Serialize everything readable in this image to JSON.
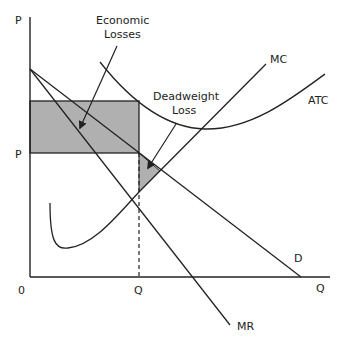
{
  "diagram": {
    "axes": {
      "y_label": "P",
      "x_label": "Q",
      "origin_label": "0",
      "price_tick": "P",
      "quantity_tick": "Q"
    },
    "curves": {
      "mc": "MC",
      "atc": "ATC",
      "demand": "D",
      "mr": "MR"
    },
    "annotations": {
      "economic_losses_line1": "Economic",
      "economic_losses_line2": "Losses",
      "deadweight_line1": "Deadweight",
      "deadweight_line2": "Loss"
    },
    "colors": {
      "line": "#222222",
      "shade": "#b0b0b0"
    }
  }
}
